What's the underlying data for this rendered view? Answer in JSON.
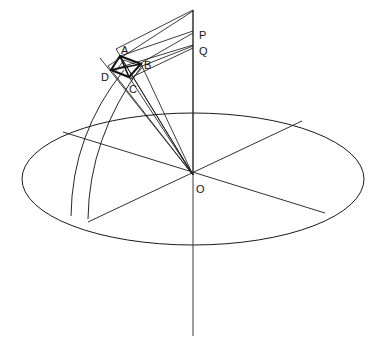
{
  "figure": {
    "canvas": {
      "width": 381,
      "height": 353
    },
    "stroke_color": "#1a1a1a",
    "background_color": "#ffffff",
    "thin_stroke_width": 0.9,
    "heavy_stroke_width": 1.9
  },
  "labels": [
    {
      "id": "A",
      "text": "A",
      "x": 121,
      "y": 45,
      "role": "quadrilateral-vertex"
    },
    {
      "id": "B",
      "text": "B",
      "x": 144,
      "y": 60,
      "role": "quadrilateral-vertex"
    },
    {
      "id": "C",
      "text": "C",
      "x": 129,
      "y": 84,
      "role": "quadrilateral-vertex"
    },
    {
      "id": "D",
      "text": "D",
      "x": 101,
      "y": 72,
      "role": "quadrilateral-vertex"
    },
    {
      "id": "P",
      "text": "P",
      "x": 199,
      "y": 30,
      "role": "axis-point"
    },
    {
      "id": "Q",
      "text": "Q",
      "x": 199,
      "y": 46,
      "role": "axis-point"
    },
    {
      "id": "O",
      "text": "O",
      "x": 196,
      "y": 184,
      "role": "center-point"
    }
  ],
  "geometry": {
    "center": {
      "x": 193,
      "y": 175,
      "name": "O"
    },
    "ellipse": {
      "cx": 193,
      "cy": 179,
      "rx": 171,
      "ry": 66,
      "name": "horizon-plane"
    },
    "vertical_axis": {
      "x": 193,
      "y_top": 10,
      "y_bottom": 336,
      "name": "polar-axis"
    },
    "chords": [
      {
        "name": "chord-nw-se",
        "x1": 63,
        "y1": 132,
        "x2": 325,
        "y2": 213
      },
      {
        "name": "chord-sw-ne",
        "x1": 88,
        "y1": 222,
        "x2": 302,
        "y2": 121
      }
    ],
    "arcs": [
      {
        "name": "meridian-arc-outer",
        "x1": 124,
        "y1": 70,
        "cx": 60,
        "cy": 146,
        "x2": 71,
        "y2": 216
      },
      {
        "name": "meridian-arc-inner",
        "x1": 140,
        "y1": 68,
        "cx": 78,
        "cy": 150,
        "x2": 88,
        "y2": 219
      }
    ],
    "rays_from_center": [
      {
        "name": "ray-O-to-axis-top",
        "x2": 193,
        "y2": 10
      },
      {
        "name": "ray-O-to-P",
        "x2": 193,
        "y2": 32
      },
      {
        "name": "ray-O-to-Q",
        "x2": 193,
        "y2": 47
      },
      {
        "name": "ray-O-to-A",
        "x2": 120,
        "y2": 56
      },
      {
        "name": "ray-O-to-B",
        "x2": 141,
        "y2": 64
      },
      {
        "name": "ray-O-to-C",
        "x2": 129,
        "y2": 77
      },
      {
        "name": "ray-O-to-D",
        "x2": 111,
        "y2": 70
      }
    ],
    "quadrilateral": {
      "name": "quadrilateral-ABCD",
      "vertices": [
        {
          "id": "A",
          "x": 120,
          "y": 56
        },
        {
          "id": "B",
          "x": 141,
          "y": 64
        },
        {
          "id": "C",
          "x": 129,
          "y": 77
        },
        {
          "id": "D",
          "x": 111,
          "y": 70
        }
      ]
    },
    "upper_rays": [
      {
        "name": "upper-ray-A-to-axis-top",
        "x1": 120,
        "y1": 56,
        "x2": 193,
        "y2": 10
      },
      {
        "name": "upper-ray-D-to-axis-top",
        "x1": 111,
        "y1": 70,
        "x2": 193,
        "y2": 10
      },
      {
        "name": "upper-ray-A-to-P",
        "x1": 120,
        "y1": 56,
        "x2": 193,
        "y2": 32
      },
      {
        "name": "upper-ray-B-to-P",
        "x1": 141,
        "y1": 64,
        "x2": 193,
        "y2": 32
      },
      {
        "name": "upper-ray-D-to-Q",
        "x1": 111,
        "y1": 70,
        "x2": 193,
        "y2": 47
      },
      {
        "name": "upper-ray-C-to-Q",
        "x1": 129,
        "y1": 77,
        "x2": 193,
        "y2": 47
      },
      {
        "name": "upper-ray-B-to-Q",
        "x1": 141,
        "y1": 64,
        "x2": 193,
        "y2": 47
      }
    ]
  }
}
